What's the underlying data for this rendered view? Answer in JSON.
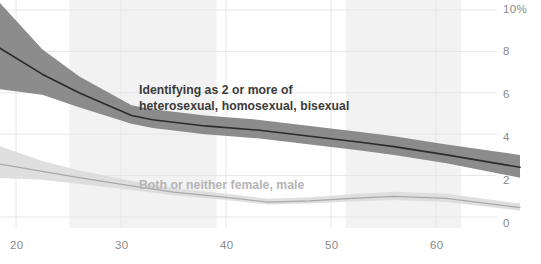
{
  "chart_data": {
    "type": "line",
    "title": "",
    "subtitle": "",
    "xlabel": "",
    "ylabel": "",
    "xlim": [
      18,
      68
    ],
    "ylim": [
      0,
      10
    ],
    "grid": true,
    "legend_position": "inline-annotation",
    "x_ticks": [
      "20",
      "30",
      "40",
      "50",
      "60"
    ],
    "x_tick_values": [
      20,
      30,
      40,
      50,
      60
    ],
    "y_ticks": [
      "10%",
      "8",
      "6",
      "4",
      "2",
      "0"
    ],
    "y_tick_values": [
      10,
      8,
      6,
      4,
      2,
      0
    ],
    "series": [
      {
        "name": "Identifying as 2 or more of heterosexual, homosexual, bisexual",
        "color": "#6b6b6b",
        "line_color": "#2b2b2b",
        "band_color": "#808080",
        "x": [
          18.0,
          22.5,
          26.0,
          31.0,
          33.0,
          38.0,
          43.0,
          48.0,
          53.0,
          56.0,
          61.0,
          68.0
        ],
        "values": [
          8.3,
          6.9,
          6.0,
          4.9,
          4.7,
          4.4,
          4.2,
          3.9,
          3.6,
          3.4,
          3.0,
          2.4
        ],
        "band_low": [
          6.2,
          5.9,
          5.3,
          4.5,
          4.3,
          4.0,
          3.8,
          3.5,
          3.2,
          3.0,
          2.6,
          1.9
        ],
        "band_high": [
          10.6,
          8.1,
          6.8,
          5.4,
          5.2,
          4.9,
          4.7,
          4.4,
          4.1,
          3.9,
          3.5,
          3.0
        ]
      },
      {
        "name": "Both or neither female, male",
        "color": "#c9c9c9",
        "line_color": "#a8a8a8",
        "band_color": "#dcdcdc",
        "x": [
          18.0,
          22.5,
          26.0,
          31.0,
          35.0,
          40.0,
          44.0,
          48.0,
          52.0,
          56.0,
          61.0,
          68.0
        ],
        "values": [
          2.6,
          2.2,
          1.9,
          1.5,
          1.2,
          0.95,
          0.72,
          0.78,
          0.9,
          1.0,
          0.9,
          0.45
        ],
        "band_low": [
          1.9,
          1.8,
          1.6,
          1.3,
          1.05,
          0.82,
          0.6,
          0.65,
          0.75,
          0.82,
          0.72,
          0.3
        ],
        "band_high": [
          3.5,
          2.7,
          2.25,
          1.75,
          1.4,
          1.12,
          0.88,
          0.95,
          1.1,
          1.22,
          1.12,
          0.65
        ]
      }
    ],
    "annotations": [
      {
        "id": "primary",
        "line1": "Identifying as 2 or more of",
        "line2": "heterosexual, homosexual, bisexual",
        "color": "#3b3b3b"
      },
      {
        "id": "secondary",
        "line1": "Both or neither female, male",
        "line2": "",
        "color": "#b5b5b5"
      }
    ],
    "shaded_bands": [
      {
        "x_start": 25.1,
        "x_end": 39.1
      },
      {
        "x_start": 51.4,
        "x_end": 62.4
      }
    ],
    "colors": {
      "grid": "#e6e6e6",
      "tick_text": "#8a8a8a",
      "background": "#ffffff",
      "shade": "#f2f2f2"
    }
  }
}
